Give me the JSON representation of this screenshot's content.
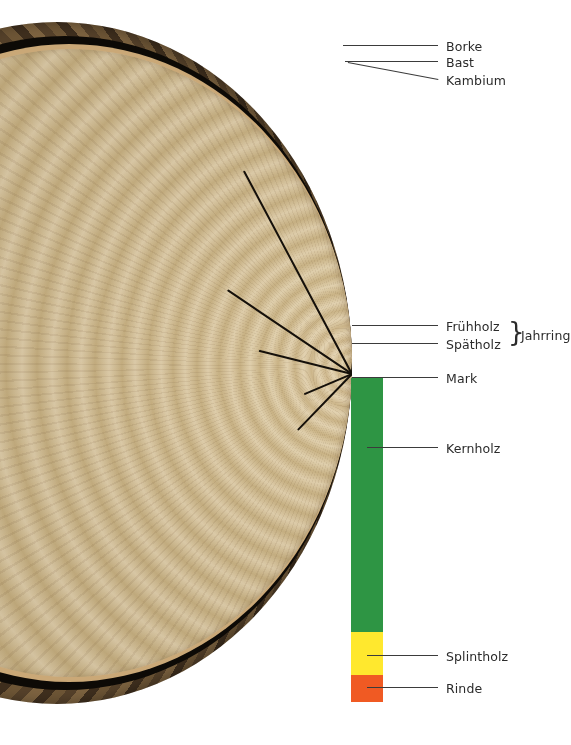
{
  "figure": {
    "background_color": "#ffffff"
  },
  "colors": {
    "heartwood": "#2e9544",
    "sapwood": "#ffe82e",
    "bark": "#f05a23",
    "leader_line": "#3b3b3b",
    "label_text": "#2b2b2b",
    "bark_dark": "#55412a",
    "wood_light": "#d9c59e"
  },
  "color_bar": {
    "left": 351,
    "width": 32,
    "segments": [
      {
        "name": "heartwood",
        "label_key": "kernholz",
        "color": "#2e9544",
        "top": 378,
        "height": 254
      },
      {
        "name": "sapwood",
        "label_key": "splintholz",
        "color": "#ffe82e",
        "top": 632,
        "height": 43
      },
      {
        "name": "bark",
        "label_key": "rinde",
        "color": "#f05a23",
        "top": 675,
        "height": 27
      }
    ]
  },
  "labels": [
    {
      "id": "borke",
      "text": "Borke",
      "text_x": 446,
      "text_y": 39,
      "line_x1": 343,
      "line_x2": 438,
      "line_y": 45,
      "slant": false
    },
    {
      "id": "bast",
      "text": "Bast",
      "text_x": 446,
      "text_y": 55,
      "line_x1": 345,
      "line_x2": 438,
      "line_y": 61,
      "slant": false
    },
    {
      "id": "kambium",
      "text": "Kambium",
      "text_x": 446,
      "text_y": 73,
      "line_x1": 348,
      "line_x2": 438,
      "line_y": 79,
      "slant": true,
      "slant_y_start": 62
    },
    {
      "id": "fruehholz",
      "text": "Frühholz",
      "text_x": 446,
      "text_y": 319,
      "line_x1": 352,
      "line_x2": 438,
      "line_y": 325,
      "slant": false
    },
    {
      "id": "spaetholz",
      "text": "Spätholz",
      "text_x": 446,
      "text_y": 337,
      "line_x1": 352,
      "line_x2": 438,
      "line_y": 343,
      "slant": false
    },
    {
      "id": "mark",
      "text": "Mark",
      "text_x": 446,
      "text_y": 371,
      "line_x1": 352,
      "line_x2": 438,
      "line_y": 377,
      "slant": false
    },
    {
      "id": "kernholz",
      "text": "Kernholz",
      "text_x": 446,
      "text_y": 441,
      "line_x1": 367,
      "line_x2": 438,
      "line_y": 447,
      "slant": false
    },
    {
      "id": "splintholz",
      "text": "Splintholz",
      "text_x": 446,
      "text_y": 649,
      "line_x1": 367,
      "line_x2": 438,
      "line_y": 655,
      "slant": false
    },
    {
      "id": "rinde",
      "text": "Rinde",
      "text_x": 446,
      "text_y": 681,
      "line_x1": 367,
      "line_x2": 438,
      "line_y": 687,
      "slant": false
    }
  ],
  "group_brace": {
    "text": "Jahrring",
    "symbol": "}",
    "brace_x": 508,
    "brace_y": 319,
    "text_x": 521,
    "text_y": 328,
    "members": [
      "Frühholz",
      "Spätholz"
    ]
  },
  "cracks": [
    {
      "angle": -46,
      "length": 78,
      "thickness": 2.2,
      "top": 351
    },
    {
      "angle": -23,
      "length": 52,
      "thickness": 2.0,
      "top": 351
    },
    {
      "angle": 14,
      "length": 96,
      "thickness": 2.0,
      "top": 351
    },
    {
      "angle": 34,
      "length": 150,
      "thickness": 1.8,
      "top": 351
    },
    {
      "angle": 62,
      "length": 230,
      "thickness": 1.6,
      "top": 351
    },
    {
      "angle": 96,
      "length": 200,
      "thickness": 1.5,
      "top": 351
    },
    {
      "angle": 126,
      "length": 120,
      "thickness": 1.4,
      "top": 351
    }
  ]
}
